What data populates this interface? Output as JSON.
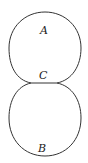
{
  "diagram": {
    "type": "two tangent loops joined by a short segment",
    "labels": {
      "top": "A",
      "middle": "C",
      "bottom": "B"
    },
    "colors": {
      "stroke": "#333333",
      "background": "#ffffff"
    }
  }
}
